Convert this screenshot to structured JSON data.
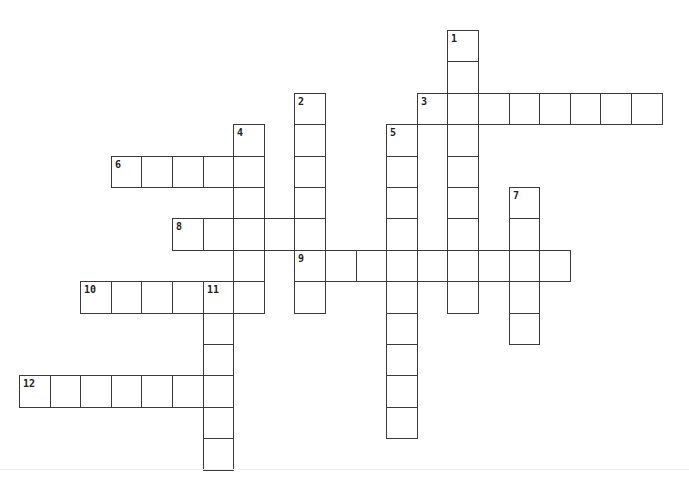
{
  "puzzle": {
    "type": "crossword",
    "grid": {
      "origin_x": 19,
      "origin_y": 30,
      "cell_width": 30.6,
      "cell_height": 31.4,
      "columns": 21,
      "rows": 14,
      "border_color": "#3a3a3a",
      "background_color": "#ffffff"
    },
    "words": [
      {
        "number": "1",
        "direction": "down",
        "row": 0,
        "col": 14,
        "length": 9
      },
      {
        "number": "2",
        "direction": "down",
        "row": 2,
        "col": 9,
        "length": 7
      },
      {
        "number": "3",
        "direction": "across",
        "row": 2,
        "col": 13,
        "length": 8
      },
      {
        "number": "4",
        "direction": "down",
        "row": 3,
        "col": 7,
        "length": 6
      },
      {
        "number": "5",
        "direction": "down",
        "row": 3,
        "col": 12,
        "length": 10
      },
      {
        "number": "6",
        "direction": "across",
        "row": 4,
        "col": 3,
        "length": 5
      },
      {
        "number": "7",
        "direction": "down",
        "row": 5,
        "col": 16,
        "length": 5
      },
      {
        "number": "8",
        "direction": "across",
        "row": 6,
        "col": 5,
        "length": 5
      },
      {
        "number": "9",
        "direction": "across",
        "row": 7,
        "col": 9,
        "length": 9
      },
      {
        "number": "10",
        "direction": "across",
        "row": 8,
        "col": 2,
        "length": 6
      },
      {
        "number": "11",
        "direction": "down",
        "row": 8,
        "col": 6,
        "length": 6
      },
      {
        "number": "12",
        "direction": "across",
        "row": 11,
        "col": 0,
        "length": 7
      }
    ]
  }
}
